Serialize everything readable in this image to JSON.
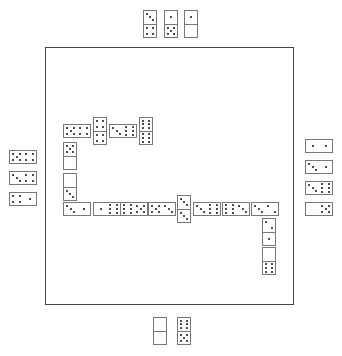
{
  "game": {
    "title": "Dominoes",
    "colors": {
      "border": "#444444",
      "tile_border": "#777777",
      "pip": "#111111",
      "background": "#ffffff"
    }
  },
  "board": {
    "x": 45,
    "y": 47,
    "w": 249,
    "h": 258
  },
  "hands": {
    "top": [
      {
        "a": 3,
        "b": 4,
        "x": 143,
        "y": 10,
        "o": "v"
      },
      {
        "a": 1,
        "b": 5,
        "x": 164,
        "y": 10,
        "o": "v"
      },
      {
        "a": 1,
        "b": 0,
        "x": 184,
        "y": 10,
        "o": "v"
      }
    ],
    "left": [
      {
        "a": 5,
        "b": 4,
        "x": 9,
        "y": 150,
        "o": "h"
      },
      {
        "a": 3,
        "b": 4,
        "x": 9,
        "y": 171,
        "o": "h"
      },
      {
        "a": 4,
        "b": 1,
        "x": 9,
        "y": 192,
        "o": "h"
      }
    ],
    "right": [
      {
        "a": 1,
        "b": 1,
        "x": 305,
        "y": 139,
        "o": "h"
      },
      {
        "a": 3,
        "b": 1,
        "x": 305,
        "y": 160,
        "o": "h"
      },
      {
        "a": 3,
        "b": 6,
        "x": 305,
        "y": 181,
        "o": "h"
      },
      {
        "a": 0,
        "b": 5,
        "x": 305,
        "y": 202,
        "o": "h"
      }
    ],
    "bottom": [
      {
        "a": 0,
        "b": 0,
        "x": 153,
        "y": 317,
        "o": "v"
      },
      {
        "a": 6,
        "b": 5,
        "x": 177,
        "y": 317,
        "o": "v"
      }
    ]
  },
  "chain": [
    {
      "a": 5,
      "b": 4,
      "x": 63,
      "y": 124,
      "o": "h"
    },
    {
      "a": 4,
      "b": 4,
      "x": 93,
      "y": 117,
      "o": "v"
    },
    {
      "a": 3,
      "b": 6,
      "x": 109,
      "y": 124,
      "o": "h"
    },
    {
      "a": 6,
      "b": 6,
      "x": 139,
      "y": 117,
      "o": "v"
    },
    {
      "a": 5,
      "b": 0,
      "x": 63,
      "y": 142,
      "o": "v"
    },
    {
      "a": 0,
      "b": 3,
      "x": 63,
      "y": 173,
      "o": "v"
    },
    {
      "a": 3,
      "b": 1,
      "x": 63,
      "y": 202,
      "o": "h"
    },
    {
      "a": 1,
      "b": 6,
      "x": 93,
      "y": 202,
      "o": "h"
    },
    {
      "a": 6,
      "b": 5,
      "x": 120,
      "y": 202,
      "o": "h"
    },
    {
      "a": 5,
      "b": 3,
      "x": 148,
      "y": 202,
      "o": "h"
    },
    {
      "a": 3,
      "b": 3,
      "x": 177,
      "y": 195,
      "o": "v"
    },
    {
      "a": 3,
      "b": 6,
      "x": 193,
      "y": 202,
      "o": "h"
    },
    {
      "a": 6,
      "b": 3,
      "x": 222,
      "y": 202,
      "o": "h"
    },
    {
      "a": 3,
      "b": 2,
      "x": 251,
      "y": 202,
      "o": "h"
    },
    {
      "a": 2,
      "b": 1,
      "x": 262,
      "y": 218,
      "o": "v"
    },
    {
      "a": 0,
      "b": 6,
      "x": 262,
      "y": 247,
      "o": "v"
    }
  ]
}
